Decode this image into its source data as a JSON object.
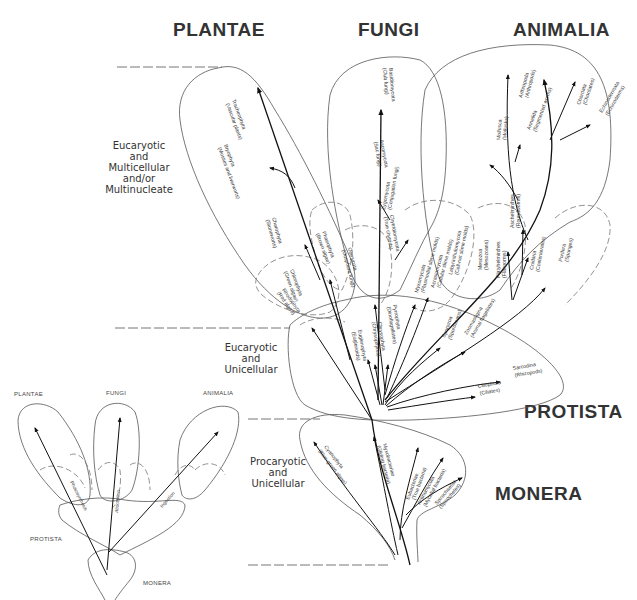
{
  "kingdoms": {
    "plantae": "PLANTAE",
    "fungi": "FUNGI",
    "animalia": "ANIMALIA",
    "protista": "PROTISTA",
    "monera": "MONERA"
  },
  "levels": {
    "multicellular": [
      "Eucaryotic",
      "and",
      "Multicellular",
      "and/or",
      "Multinucleate"
    ],
    "eucaryotic_unicellular": [
      "Eucaryotic",
      "and",
      "Unicellular"
    ],
    "procaryotic": [
      "Procaryotic",
      "and",
      "Unicellular"
    ]
  },
  "taxa": {
    "plantae": [
      {
        "name": "Tracheophyta",
        "common": "(Vascular plants)"
      },
      {
        "name": "Bryophyta",
        "common": "(Mosses and liverworts)"
      },
      {
        "name": "Charophyta",
        "common": "(Stoneworts)"
      },
      {
        "name": "Chlorophyta",
        "common": "(Green algae)"
      },
      {
        "name": "Phaeophyta",
        "common": "(Brown algae)"
      },
      {
        "name": "Rhodophyta",
        "common": "(Red algae)"
      }
    ],
    "fungi": [
      {
        "name": "Basidiomycota",
        "common": "(Club fungi)"
      },
      {
        "name": "Ascomycota",
        "common": "(Sac fungi)"
      },
      {
        "name": "Zygomycota",
        "common": "(Conjugation fungi)"
      },
      {
        "name": "Chytridiomycota",
        "common": "(True chytrids)"
      },
      {
        "name": "Oomycota",
        "common": "(Oosphere fungi)"
      },
      {
        "name": "Myxomycota",
        "common": "(Plasmodial slime molds)"
      },
      {
        "name": "Acrasiomycota",
        "common": "(Cellular slime molds)"
      },
      {
        "name": "Labyrinthulomycota",
        "common": "(Cell-net slime molds)"
      }
    ],
    "animalia": [
      {
        "name": "Arthropoda",
        "common": "(Arthropods)"
      },
      {
        "name": "Annelida",
        "common": "(Segmented worms)"
      },
      {
        "name": "Mollusca",
        "common": "(Mollusks)"
      },
      {
        "name": "Chordata",
        "common": "(Chordates)"
      },
      {
        "name": "Echinodermata",
        "common": "(Echinoderms)"
      },
      {
        "name": "Aschelminthes",
        "common": "(Roundworms)"
      },
      {
        "name": "Mesozoa",
        "common": "(Mesozoans)"
      },
      {
        "name": "Platyhelminthes",
        "common": "(Flatworms)"
      },
      {
        "name": "Cnidaria",
        "common": "(Coelenterates)"
      },
      {
        "name": "Porifera",
        "common": "(Sponges)"
      }
    ],
    "protista": [
      {
        "name": "Euglenophyta",
        "common": "(Euglenoids)"
      },
      {
        "name": "Chrysophyta",
        "common": "(Chrysophytes)"
      },
      {
        "name": "Pyrrophyta",
        "common": "(Dinoflagellates)"
      },
      {
        "name": "Sporozoa",
        "common": "(Sporozoans)"
      },
      {
        "name": "Zoomastigina",
        "common": "(Animal flagellates)"
      },
      {
        "name": "Sarcodina",
        "common": "(Rhizopods)"
      },
      {
        "name": "Ciliophora",
        "common": "(Ciliates)"
      }
    ],
    "monera": [
      {
        "name": "Cyanophyta",
        "common": "(Blue-green algae)"
      },
      {
        "name": "Myxobacteriae",
        "common": "(Gliding bacteria)"
      },
      {
        "name": "Eubacteriae",
        "common": "(True bacteria)"
      },
      {
        "name": "Actinomycota",
        "common": "(Mycelial bacteria)"
      },
      {
        "name": "Spirochaetae",
        "common": "(Spirochetes)"
      }
    ]
  },
  "inset": {
    "plantae": "PLANTAE",
    "fungi": "FUNGI",
    "animalia": "ANIMALIA",
    "protista": "PROTISTA",
    "monera": "MONERA",
    "modes": [
      "Photosynthesis",
      "Absorption",
      "Ingestion"
    ]
  }
}
